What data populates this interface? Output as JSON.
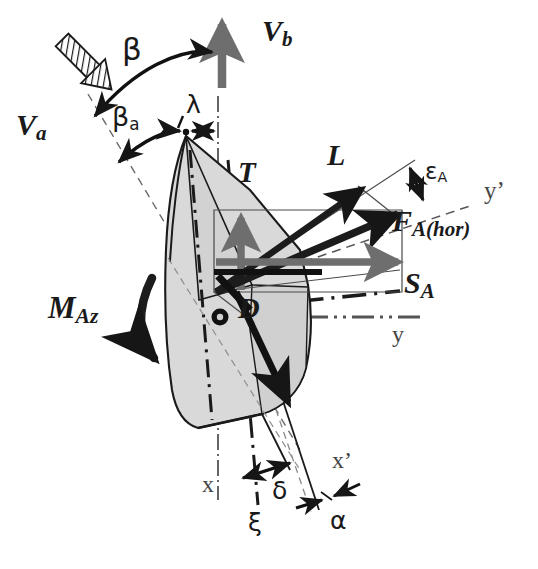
{
  "figure": {
    "kind": "force-diagram",
    "domain": "sailing-aerodynamics-vector-diagram",
    "background_color": "#ffffff",
    "ink_color": "#1a1a1a",
    "sail_fill_color": "#d9d9d9",
    "sail_stroke_color": "#1a1a1a",
    "gray_vector_color": "#707070",
    "axis_text_color": "#444444"
  },
  "labels": {
    "v_a": "V",
    "v_a_sub": "a",
    "v_b": "V",
    "v_b_sub": "b",
    "beta": "β",
    "beta_a": "β",
    "beta_a_sub": "a",
    "lambda": "λ",
    "thrust": "T",
    "lift": "L",
    "drag": "D",
    "f_a_hor": "F",
    "f_a_hor_sub": "A(hor)",
    "s_a": "S",
    "s_a_sub": "A",
    "epsilon_a": "ε",
    "epsilon_a_sub": "A",
    "m_az": "M",
    "m_az_sub": "Az",
    "delta": "δ",
    "xi": "ξ",
    "alpha": "α",
    "axis_x": "x",
    "axis_x_prime": "x’",
    "axis_y": "y",
    "axis_y_prime": "y’"
  },
  "vectors": [
    {
      "name": "V_a",
      "label": "Va",
      "style": "hatched-arrow",
      "direction_deg": 135,
      "description": "apparent wind, hatched block arrow pointing down-right"
    },
    {
      "name": "V_b",
      "label": "Vb",
      "style": "thick-gray-arrow",
      "direction_deg": 90,
      "description": "boat velocity, vertical thick arrow pointing up"
    },
    {
      "name": "T",
      "label": "T",
      "style": "thick-gray-arrow",
      "direction_deg": 90,
      "description": "thrust component, short vertical arrow up"
    },
    {
      "name": "L",
      "label": "L",
      "style": "thick-black-arrow",
      "direction_deg": 28,
      "description": "lift force"
    },
    {
      "name": "D",
      "label": "D",
      "style": "thick-black-arrow",
      "direction_deg": -62,
      "description": "drag force"
    },
    {
      "name": "F_A(hor)",
      "label": "FA(hor)",
      "style": "thick-black-arrow",
      "direction_deg": 18,
      "description": "resultant horizontal aerodynamic force"
    },
    {
      "name": "S_A",
      "label": "SA",
      "style": "thick-gray-arrow",
      "direction_deg": 0,
      "description": "side force, horizontal arrow to the right"
    },
    {
      "name": "M_Az",
      "label": "MAz",
      "style": "curved-arrow",
      "description": "yawing moment, curved arrow rotating clockwise"
    }
  ],
  "angles": [
    {
      "name": "beta",
      "label": "β",
      "between": [
        "V_a",
        "V_b"
      ],
      "style": "double-headed-arc"
    },
    {
      "name": "beta_a",
      "label": "βa",
      "between": [
        "V_a",
        "mast-axis"
      ],
      "style": "double-headed-arc"
    },
    {
      "name": "lambda",
      "label": "λ",
      "between": [
        "mast-top",
        "vertical-axis"
      ],
      "style": "double-headed-straight"
    },
    {
      "name": "epsilon_A",
      "label": "εA",
      "between": [
        "F_A(hor)",
        "y-prime-axis"
      ],
      "style": "double-headed-straight"
    },
    {
      "name": "delta",
      "label": "δ",
      "between": [
        "x-axis",
        "keel-line"
      ],
      "style": "double-headed-straight"
    },
    {
      "name": "alpha",
      "label": "α",
      "between": [
        "hull-centerline",
        "x-prime-axis"
      ],
      "style": "double-headed-straight"
    },
    {
      "name": "xi",
      "label": "ξ",
      "between": [
        "x-axis",
        "xi-axis"
      ],
      "style": "dash-dot-axis"
    }
  ],
  "axes": [
    {
      "name": "x",
      "label": "x",
      "style": "dash-dot",
      "orientation": "vertical"
    },
    {
      "name": "x_prime",
      "label": "x’",
      "style": "solid-thin",
      "orientation": "tilted-vertical"
    },
    {
      "name": "y",
      "label": "y",
      "style": "dash-dot",
      "orientation": "horizontal"
    },
    {
      "name": "y_prime",
      "label": "y’",
      "style": "dashed",
      "orientation": "tilted-horizontal"
    },
    {
      "name": "xi",
      "label": "ξ",
      "style": "dash-dot",
      "orientation": "tilted-vertical"
    }
  ]
}
